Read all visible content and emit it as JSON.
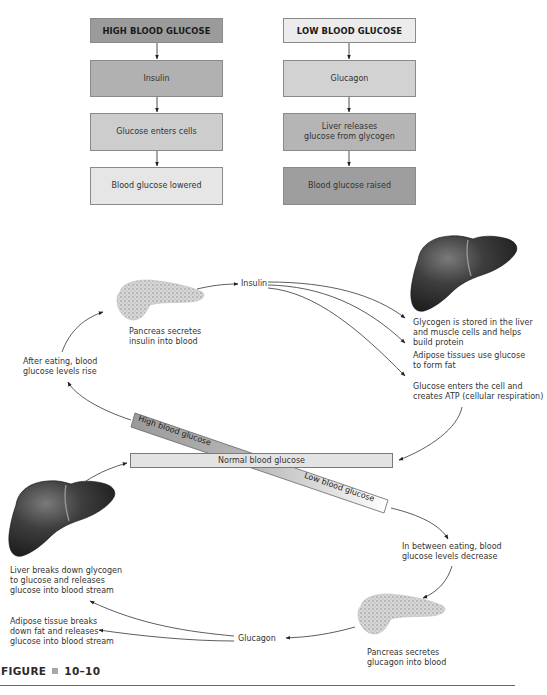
{
  "flowchart": {
    "high": {
      "header": "HIGH BLOOD GLUCOSE",
      "steps": [
        "Insulin",
        "Glucose enters cells",
        "Blood glucose lowered"
      ],
      "colors": [
        "#9b9b9b",
        "#b1b1b1",
        "#cdcdcd",
        "#e6e6e6"
      ]
    },
    "low": {
      "header": "LOW BLOOD GLUCOSE",
      "steps": [
        "Glucagon",
        "Liver releases\nglucose from glycogen",
        "Blood glucose raised"
      ],
      "colors": [
        "#ececec",
        "#d2d2d2",
        "#b5b5b5",
        "#9e9e9e"
      ]
    }
  },
  "cycle": {
    "insulin_label": "Insulin",
    "glucagon_label": "Glucagon",
    "pancreas_insulin": "Pancreas secretes\ninsulin into blood",
    "pancreas_glucagon": "Pancreas secretes\nglucagon into blood",
    "after_eating": "After eating, blood\nglucose levels rise",
    "between_eating": "In between eating, blood\nglucose levels decrease",
    "insulin_effects": [
      "Glycogen is stored in the liver\nand muscle cells and helps\nbuild protein",
      "Adipose tissues use glucose\nto form fat",
      "Glucose enters the cell and\ncreates ATP (cellular respiration)"
    ],
    "glucagon_effects": [
      "Liver breaks down glycogen\nto glucose and releases\nglucose into blood stream",
      "Adipose tissue breaks\ndown fat and releases\nglucose into blood stream"
    ],
    "normal_bar": "Normal blood glucose",
    "high_bar": "High blood glucose",
    "low_bar": "Low blood glucose"
  },
  "figure": {
    "label": "FIGURE",
    "number": "10–10"
  }
}
